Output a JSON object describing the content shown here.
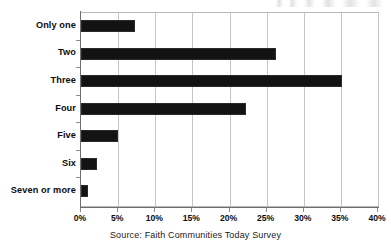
{
  "chart_data": {
    "type": "bar",
    "orientation": "horizontal",
    "title": "",
    "subtitle": "",
    "xlabel": "",
    "ylabel": "",
    "categories": [
      "Only one",
      "Two",
      "Three",
      "Four",
      "Five",
      "Six",
      "Seven or more"
    ],
    "values": [
      7.3,
      26.3,
      35.2,
      22.2,
      5.0,
      2.1,
      1.0
    ],
    "series": [
      {
        "name": "Percent of congregations",
        "values": [
          7.3,
          26.3,
          35.2,
          22.2,
          5.0,
          2.1,
          1.0
        ]
      }
    ],
    "xlim": [
      0,
      40
    ],
    "ylim": null,
    "xticks": [
      0,
      5,
      10,
      15,
      20,
      25,
      30,
      35,
      40
    ],
    "xticklabels": [
      "0%",
      "5%",
      "10%",
      "15%",
      "20%",
      "25%",
      "30%",
      "35%",
      "40%"
    ],
    "grid": "vertical",
    "legend": null,
    "legend_position": "none",
    "bar_color": "#131313",
    "gridline_color": "#c4c4c4",
    "axis_color": "#6e6e6e",
    "annotations": [
      "Source: Faith Communities Today Survey"
    ]
  },
  "caption": {
    "source_text": "Source: Faith Communities Today Survey"
  },
  "artifact": {
    "top_edge_note": ""
  }
}
